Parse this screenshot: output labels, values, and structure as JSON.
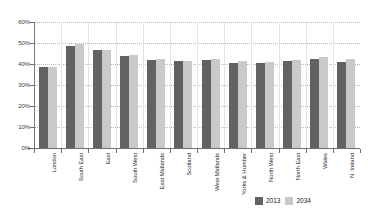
{
  "chart_data": {
    "type": "bar",
    "title": "",
    "subtitle": "",
    "xlabel": "",
    "ylabel": "",
    "ylim": [
      0,
      60
    ],
    "yticks": [
      "0%",
      "10%",
      "20%",
      "30%",
      "40%",
      "50%",
      "60%"
    ],
    "ytick_values": [
      0,
      10,
      20,
      30,
      40,
      50,
      60
    ],
    "grid": true,
    "legend_position": "bottom-right",
    "value_suffix": "%",
    "categories": [
      "London",
      "South East",
      "East",
      "South West",
      "East Midlands",
      "Scotland",
      "West Midlands",
      "Yorks & Humber",
      "North West",
      "North East",
      "Wales",
      "N. Ireland"
    ],
    "series": [
      {
        "name": "2013",
        "color": "#626262",
        "values": [
          38.8,
          48.5,
          46.5,
          43.8,
          42.0,
          41.3,
          41.8,
          40.4,
          40.4,
          41.2,
          42.5,
          41.0
        ]
      },
      {
        "name": "2034",
        "color": "#c9c9c9",
        "values": [
          38.8,
          49.4,
          46.5,
          44.1,
          42.5,
          41.2,
          42.4,
          41.3,
          41.0,
          42.0,
          43.5,
          42.2
        ]
      }
    ]
  },
  "legend": {
    "items": [
      {
        "label": "2013",
        "color": "#626262"
      },
      {
        "label": "2034",
        "color": "#c9c9c9"
      }
    ]
  }
}
